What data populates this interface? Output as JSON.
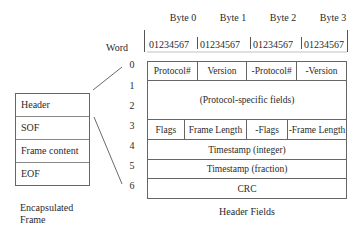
{
  "header_row": {
    "bytes": [
      "Byte 0",
      "Byte 1",
      "Byte 2",
      "Byte 3"
    ],
    "word_label": "Word",
    "bits": [
      "01234567",
      "01234567",
      "01234567",
      "01234567"
    ]
  },
  "word_numbers": [
    "0",
    "1",
    "2",
    "3",
    "4",
    "5",
    "6"
  ],
  "header_fields": {
    "row0": [
      "Protocol#",
      "Version",
      "-Protocol#",
      "-Version"
    ],
    "row1_2": "(Protocol-specific fields)",
    "row3": [
      "Flags",
      "Frame Length",
      "-Flags",
      "-Frame Length"
    ],
    "row4": "Timestamp (integer)",
    "row5": "Timestamp (fraction)",
    "row6": "CRC",
    "caption": "Header Fields"
  },
  "encapsulated_frame": {
    "items": [
      "Header",
      "SOF",
      "Frame content",
      "EOF"
    ],
    "caption_line1": "Encapsulated",
    "caption_line2": "Frame"
  }
}
